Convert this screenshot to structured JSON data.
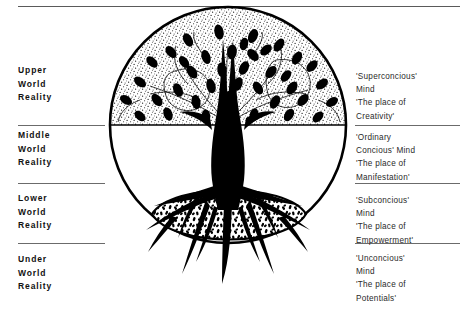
{
  "diagram": {
    "ink_color": "#000000",
    "rule_color": "#6b6b6b"
  },
  "levels": [
    {
      "id": "upper",
      "left_label": "Upper\nWorld\nReality",
      "right_label": "'Superconcious'\nMind\n'The place of\nCreativity'"
    },
    {
      "id": "middle",
      "left_label": "Middle\nWorld\nReality",
      "right_label": "'Ordinary\nConcious' Mind\n'The place of\nManifestation'"
    },
    {
      "id": "lower",
      "left_label": "Lower\nWorld\nReality",
      "right_label": "'Subconcious'\nMind\n'The place of\nEmpowerment'"
    },
    {
      "id": "under",
      "left_label": "Under\nWorld\nReality",
      "right_label": "'Unconcious'\nMind\n'The place of\nPotentials'"
    }
  ]
}
